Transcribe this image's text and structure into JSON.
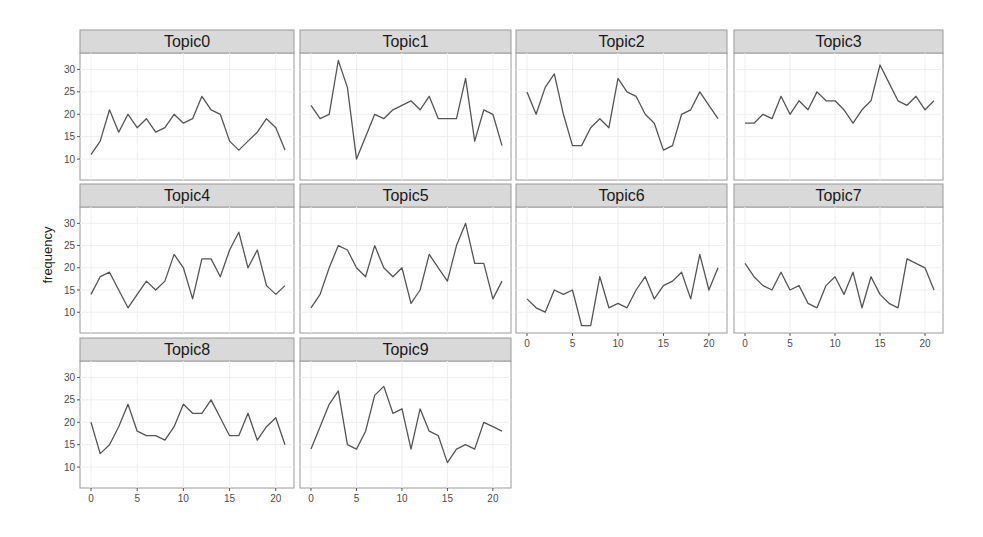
{
  "chart_data": {
    "type": "line",
    "layout": "facet_wrap",
    "ncol": 4,
    "xlabel": "",
    "ylabel": "frequency",
    "xlim": [
      0,
      21
    ],
    "ylim": [
      6,
      33
    ],
    "x_ticks": [
      0,
      5,
      10,
      15,
      20
    ],
    "y_ticks": [
      10,
      15,
      20,
      25,
      30
    ],
    "grid": true,
    "line_color": "#555555",
    "strip_fill": "#d9d9d9",
    "x": [
      0,
      1,
      2,
      3,
      4,
      5,
      6,
      7,
      8,
      9,
      10,
      11,
      12,
      13,
      14,
      15,
      16,
      17,
      18,
      19,
      20,
      21
    ],
    "series": [
      {
        "name": "Topic0",
        "values": [
          11,
          14,
          21,
          16,
          20,
          17,
          19,
          16,
          17,
          20,
          18,
          19,
          24,
          21,
          20,
          14,
          12,
          14,
          16,
          19,
          17,
          12
        ]
      },
      {
        "name": "Topic1",
        "values": [
          22,
          19,
          20,
          32,
          26,
          10,
          15,
          20,
          19,
          21,
          22,
          23,
          21,
          24,
          19,
          19,
          19,
          28,
          14,
          21,
          20,
          13
        ]
      },
      {
        "name": "Topic2",
        "values": [
          25,
          20,
          26,
          29,
          20,
          13,
          13,
          17,
          19,
          17,
          28,
          25,
          24,
          20,
          18,
          12,
          13,
          20,
          21,
          25,
          22,
          19
        ]
      },
      {
        "name": "Topic3",
        "values": [
          18,
          18,
          20,
          19,
          24,
          20,
          23,
          21,
          25,
          23,
          23,
          21,
          18,
          21,
          23,
          31,
          27,
          23,
          22,
          24,
          21,
          23
        ]
      },
      {
        "name": "Topic4",
        "values": [
          14,
          18,
          19,
          15,
          11,
          14,
          17,
          15,
          17,
          23,
          20,
          13,
          22,
          22,
          18,
          24,
          28,
          20,
          24,
          16,
          14,
          16
        ]
      },
      {
        "name": "Topic5",
        "values": [
          11,
          14,
          20,
          25,
          24,
          20,
          18,
          25,
          20,
          18,
          20,
          12,
          15,
          23,
          20,
          17,
          25,
          30,
          21,
          21,
          13,
          17
        ]
      },
      {
        "name": "Topic6",
        "values": [
          13,
          11,
          10,
          15,
          14,
          15,
          7,
          7,
          18,
          11,
          12,
          11,
          15,
          18,
          13,
          16,
          17,
          19,
          13,
          23,
          15,
          20
        ]
      },
      {
        "name": "Topic7",
        "values": [
          21,
          18,
          16,
          15,
          19,
          15,
          16,
          12,
          11,
          16,
          18,
          14,
          19,
          11,
          18,
          14,
          12,
          11,
          22,
          21,
          20,
          15
        ]
      },
      {
        "name": "Topic8",
        "values": [
          20,
          13,
          15,
          19,
          24,
          18,
          17,
          17,
          16,
          19,
          24,
          22,
          22,
          25,
          21,
          17,
          17,
          22,
          16,
          19,
          21,
          15
        ]
      },
      {
        "name": "Topic9",
        "values": [
          14,
          19,
          24,
          27,
          15,
          14,
          18,
          26,
          28,
          22,
          23,
          14,
          23,
          18,
          17,
          11,
          14,
          15,
          14,
          20,
          19,
          18
        ]
      }
    ]
  }
}
